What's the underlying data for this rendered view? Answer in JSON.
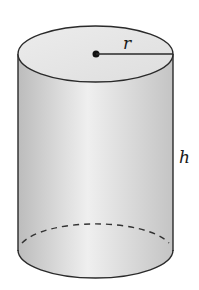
{
  "diagram": {
    "type": "cylinder",
    "labels": {
      "radius": "r",
      "height": "h"
    },
    "colors": {
      "stroke": "#2a2a2a",
      "top_face": "#e4e4e4",
      "body_light": "#efefef",
      "body_dark": "#bdbdbd",
      "background": "#ffffff"
    }
  }
}
